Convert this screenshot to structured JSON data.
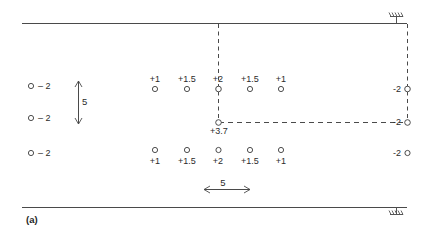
{
  "figure": {
    "caption": "(a)",
    "boundaries": {
      "top_label": "top-boundary-line",
      "bottom_label": "bottom-boundary-line"
    },
    "supports": {
      "top_symbol": "fixed-support-hatch",
      "bottom_symbol": "fixed-support-hatch"
    }
  },
  "dimensions": {
    "vertical": {
      "value": "5"
    },
    "horizontal": {
      "value": "5"
    }
  },
  "left_column": {
    "nodes": [
      {
        "label": "– 2",
        "x": 31,
        "y": 86
      },
      {
        "label": "– 2",
        "x": 31,
        "y": 118
      },
      {
        "label": "– 2",
        "x": 31,
        "y": 153
      }
    ]
  },
  "top_row": {
    "nodes": [
      {
        "label": "+1",
        "x": 155,
        "y": 89
      },
      {
        "label": "+1.5",
        "x": 187,
        "y": 89
      },
      {
        "label": "+2",
        "x": 218,
        "y": 89
      },
      {
        "label": "+1.5",
        "x": 250,
        "y": 89
      },
      {
        "label": "+1",
        "x": 281,
        "y": 89
      }
    ]
  },
  "bottom_row": {
    "nodes": [
      {
        "label": "+1",
        "x": 155,
        "y": 150
      },
      {
        "label": "+1.5",
        "x": 187,
        "y": 150
      },
      {
        "label": "+2",
        "x": 218,
        "y": 150
      },
      {
        "label": "+1.5",
        "x": 250,
        "y": 150
      },
      {
        "label": "+1",
        "x": 281,
        "y": 150
      }
    ]
  },
  "center_node": {
    "label": "+3.7",
    "x": 218,
    "y": 122
  },
  "right_column": {
    "nodes": [
      {
        "label": "-2",
        "x": 404,
        "y": 89
      },
      {
        "label": "-2",
        "x": 404,
        "y": 122
      },
      {
        "label": "-2",
        "x": 404,
        "y": 153
      }
    ]
  }
}
